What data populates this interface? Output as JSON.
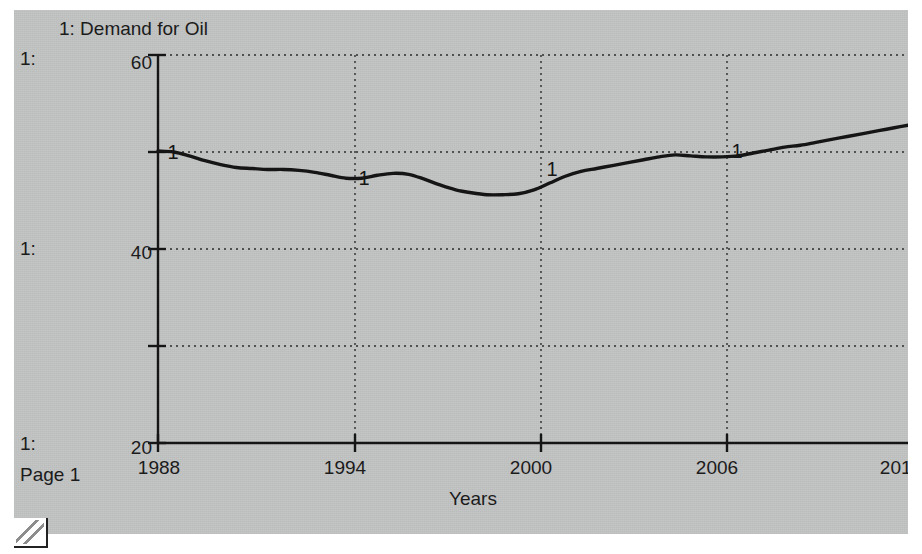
{
  "window": {
    "background_color": "#c3c4c4",
    "page_color": "#ffffff"
  },
  "chart_title": "1: Demand for Oil",
  "page_label": "Page 1",
  "series_key": {
    "top": "1:",
    "middle": "1:",
    "bottom": "1:"
  },
  "axes": {
    "x_title": "Years",
    "x_ticks": [
      "1988",
      "1994",
      "2000",
      "2006",
      "2012"
    ],
    "y_ticks": [
      "60",
      "40",
      "20"
    ]
  },
  "chart_data": {
    "type": "line",
    "title": "1: Demand for Oil",
    "xlabel": "Years",
    "ylabel": "",
    "xlim": [
      1988,
      2012
    ],
    "ylim": [
      20,
      60
    ],
    "grid": true,
    "legend_position": "inline-markers",
    "x_tick_values": [
      1988,
      1994,
      2000,
      2006,
      2012
    ],
    "y_tick_values": [
      20,
      40,
      60
    ],
    "y_gridline_values": [
      20,
      30,
      40,
      50,
      60
    ],
    "line_color": "#151515",
    "marker_labels": [
      {
        "label": "1",
        "x": 1988.3,
        "y": 50.0
      },
      {
        "label": "1",
        "x": 1994.4,
        "y": 47.3
      },
      {
        "label": "1",
        "x": 2000.4,
        "y": 48.3
      },
      {
        "label": "1",
        "x": 2006.3,
        "y": 50.1
      }
    ],
    "series": [
      {
        "name": "1: Demand for Oil",
        "x": [
          1988,
          1988.5,
          1989,
          1989.5,
          1990,
          1990.5,
          1991,
          1991.5,
          1992,
          1992.5,
          1993,
          1993.5,
          1994,
          1994.5,
          1995,
          1995.5,
          1996,
          1996.5,
          1997,
          1997.5,
          1998,
          1998.5,
          1999,
          1999.5,
          2000,
          2000.5,
          2001,
          2001.5,
          2002,
          2002.5,
          2003,
          2003.5,
          2004,
          2004.5,
          2005,
          2005.5,
          2006,
          2006.5,
          2007,
          2007.5,
          2008,
          2008.5,
          2009,
          2009.5,
          2010,
          2010.5,
          2011,
          2011.5,
          2012
        ],
        "y": [
          50.1,
          50.0,
          49.6,
          49.1,
          48.7,
          48.4,
          48.3,
          48.2,
          48.2,
          48.1,
          47.9,
          47.6,
          47.3,
          47.3,
          47.6,
          47.8,
          47.7,
          47.2,
          46.6,
          46.1,
          45.8,
          45.6,
          45.6,
          45.7,
          46.1,
          46.8,
          47.5,
          48.0,
          48.3,
          48.6,
          48.9,
          49.2,
          49.5,
          49.7,
          49.6,
          49.5,
          49.5,
          49.6,
          49.9,
          50.2,
          50.5,
          50.7,
          51.0,
          51.3,
          51.6,
          51.9,
          52.2,
          52.5,
          52.8
        ]
      }
    ]
  }
}
